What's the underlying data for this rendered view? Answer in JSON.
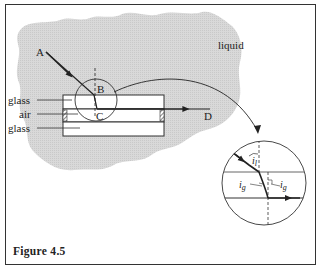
{
  "figure": {
    "caption": "Figure 4.5",
    "labels": {
      "liquid": "liquid",
      "point_a": "A",
      "point_b": "B",
      "point_c": "C",
      "point_d": "D",
      "glass_top": "glass",
      "air": "air",
      "glass_bottom": "glass"
    },
    "inset": {
      "angle_liquid": {
        "symbol": "i",
        "subscript": "l"
      },
      "angle_glass_left": {
        "symbol": "i",
        "subscript": "g"
      },
      "angle_glass_right": {
        "symbol": "i",
        "subscript": "g"
      }
    },
    "colors": {
      "liquid_fill": "#d6d6d6",
      "line": "#222222",
      "glass_fill": "#ffffff"
    }
  }
}
